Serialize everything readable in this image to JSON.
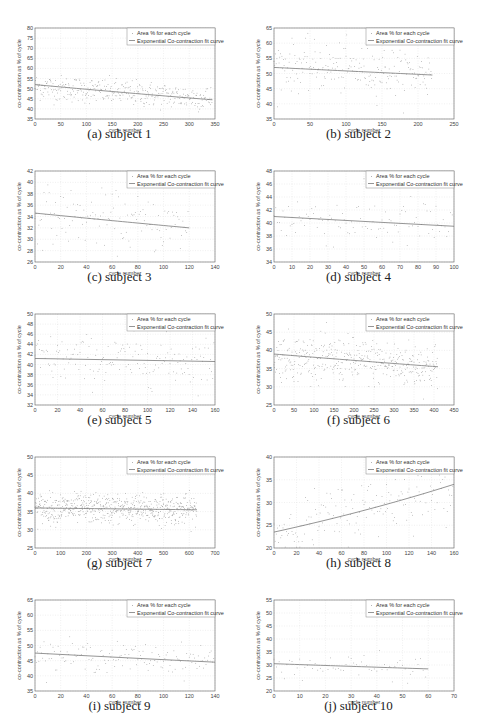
{
  "figure": {
    "common": {
      "ylabel": "co-contraction as % of cycle",
      "xlabel": "cycle number",
      "legend": [
        "Area % for each cycle",
        "Exponential Co-contraction fit curve"
      ]
    }
  },
  "chart_data": [
    {
      "id": "a",
      "type": "scatter",
      "caption": "(a) subject 1",
      "xlabel": "cycle number",
      "ylabel": "co-contraction as % of cycle",
      "xlim": [
        0,
        350
      ],
      "ylim": [
        35,
        80
      ],
      "xticks": [
        0,
        50,
        100,
        150,
        200,
        250,
        300,
        350
      ],
      "yticks": [
        35,
        40,
        45,
        50,
        55,
        60,
        65,
        70,
        75,
        80
      ],
      "legend": [
        "Area % for each cycle",
        "Exponential Co-contraction fit curve"
      ],
      "legend_position": "top-right",
      "grid": true,
      "n_points": 345,
      "scatter_mean_start": 51,
      "scatter_mean_end": 45,
      "scatter_spread": 4,
      "fit": {
        "x_start": 0,
        "x_end": 345,
        "y_start": 52,
        "y_end": 44.5
      }
    },
    {
      "id": "b",
      "type": "scatter",
      "caption": "(b) subject 2",
      "xlabel": "cycle number",
      "ylabel": "co-contraction as % of cycle",
      "xlim": [
        0,
        250
      ],
      "ylim": [
        35,
        65
      ],
      "xticks": [
        0,
        50,
        100,
        150,
        200,
        250
      ],
      "yticks": [
        35,
        40,
        45,
        50,
        55,
        60,
        65
      ],
      "legend": [
        "Area % for each cycle",
        "Exponential Co-contraction fit curve"
      ],
      "legend_position": "top-right",
      "grid": true,
      "n_points": 220,
      "scatter_mean_start": 53,
      "scatter_mean_end": 50,
      "scatter_spread": 5,
      "fit": {
        "x_start": 0,
        "x_end": 220,
        "y_start": 52,
        "y_end": 49.5
      }
    },
    {
      "id": "c",
      "type": "scatter",
      "caption": "(c) subject 3",
      "xlabel": "cycle number",
      "ylabel": "co-contraction as % of cycle",
      "xlim": [
        0,
        140
      ],
      "ylim": [
        26,
        42
      ],
      "xticks": [
        0,
        20,
        40,
        60,
        80,
        100,
        120,
        140
      ],
      "yticks": [
        26,
        28,
        30,
        32,
        34,
        36,
        38,
        40,
        42
      ],
      "legend": [
        "Area % for each cycle",
        "Exponential Co-contraction fit curve"
      ],
      "legend_position": "top-right",
      "grid": true,
      "n_points": 120,
      "scatter_mean_start": 34.5,
      "scatter_mean_end": 32,
      "scatter_spread": 3,
      "fit": {
        "x_start": 0,
        "x_end": 120,
        "y_start": 34.6,
        "y_end": 32
      }
    },
    {
      "id": "d",
      "type": "scatter",
      "caption": "(d) subject 4",
      "xlabel": "cycle number",
      "ylabel": "co-contraction as % of cycle",
      "xlim": [
        0,
        100
      ],
      "ylim": [
        34,
        48
      ],
      "xticks": [
        0,
        10,
        20,
        30,
        40,
        50,
        60,
        70,
        80,
        90,
        100
      ],
      "yticks": [
        34,
        36,
        38,
        40,
        42,
        44,
        46,
        48
      ],
      "legend": [
        "Area % for each cycle",
        "Exponential Co-contraction fit curve"
      ],
      "legend_position": "top-right",
      "grid": true,
      "n_points": 100,
      "scatter_mean_start": 41,
      "scatter_mean_end": 39.5,
      "scatter_spread": 2.5,
      "fit": {
        "x_start": 0,
        "x_end": 100,
        "y_start": 41,
        "y_end": 39.5
      }
    },
    {
      "id": "e",
      "type": "scatter",
      "caption": "(e) subject 5",
      "xlabel": "cycle number",
      "ylabel": "co-contraction as % of cycle",
      "xlim": [
        0,
        160
      ],
      "ylim": [
        32,
        50
      ],
      "xticks": [
        0,
        20,
        40,
        60,
        80,
        100,
        120,
        140,
        160
      ],
      "yticks": [
        32,
        34,
        36,
        38,
        40,
        42,
        44,
        46,
        48,
        50
      ],
      "legend": [
        "Area % for each cycle",
        "Exponential Co-contraction fit curve"
      ],
      "legend_position": "top-right",
      "grid": true,
      "n_points": 160,
      "scatter_mean_start": 41,
      "scatter_mean_end": 40.6,
      "scatter_spread": 3,
      "fit": {
        "x_start": 0,
        "x_end": 160,
        "y_start": 41.2,
        "y_end": 40.6
      }
    },
    {
      "id": "f",
      "type": "scatter",
      "caption": "(f) subject 6",
      "xlabel": "cycle number",
      "ylabel": "co-contraction as % of cycle",
      "xlim": [
        0,
        450
      ],
      "ylim": [
        25,
        50
      ],
      "xticks": [
        0,
        50,
        100,
        150,
        200,
        250,
        300,
        350,
        400,
        450
      ],
      "yticks": [
        25,
        30,
        35,
        40,
        45,
        50
      ],
      "legend": [
        "Area % for each cycle",
        "Exponential Co-contraction fit curve"
      ],
      "legend_position": "top-right",
      "grid": true,
      "n_points": 410,
      "scatter_mean_start": 38.5,
      "scatter_mean_end": 35.5,
      "scatter_spread": 4,
      "fit": {
        "x_start": 0,
        "x_end": 410,
        "y_start": 39,
        "y_end": 35.5
      }
    },
    {
      "id": "g",
      "type": "scatter",
      "caption": "(g) subject 7",
      "xlabel": "cycle number",
      "ylabel": "co-contraction as % of cycle",
      "xlim": [
        0,
        700
      ],
      "ylim": [
        25,
        50
      ],
      "xticks": [
        0,
        100,
        200,
        300,
        400,
        500,
        600,
        700
      ],
      "yticks": [
        25,
        30,
        35,
        40,
        45,
        50
      ],
      "legend": [
        "Area % for each cycle",
        "Exponential Co-contraction fit curve"
      ],
      "legend_position": "top-right",
      "grid": true,
      "n_points": 630,
      "scatter_mean_start": 36,
      "scatter_mean_end": 35.5,
      "scatter_spread": 2.5,
      "fit": {
        "x_start": 0,
        "x_end": 630,
        "y_start": 36,
        "y_end": 35.5
      }
    },
    {
      "id": "h",
      "type": "scatter",
      "caption": "(h) subject 8",
      "xlabel": "cycle number",
      "ylabel": "co-contraction as % of cycle",
      "xlim": [
        0,
        160
      ],
      "ylim": [
        20,
        40
      ],
      "xticks": [
        0,
        20,
        40,
        60,
        80,
        100,
        120,
        140,
        160
      ],
      "yticks": [
        20,
        25,
        30,
        35,
        40
      ],
      "legend": [
        "Area % for each cycle",
        "Exponential Co-contraction fit curve"
      ],
      "legend_position": "top-right",
      "grid": true,
      "n_points": 160,
      "scatter_mean_start": 23.5,
      "scatter_mean_end": 34,
      "scatter_spread": 4,
      "fit": {
        "x_start": 0,
        "x_end": 160,
        "y_start": 23.5,
        "y_end": 34
      }
    },
    {
      "id": "i",
      "type": "scatter",
      "caption": "(i) subject 9",
      "xlabel": "cycle number",
      "ylabel": "co-contraction as % of cycle",
      "xlim": [
        0,
        140
      ],
      "ylim": [
        35,
        65
      ],
      "xticks": [
        0,
        20,
        40,
        60,
        80,
        100,
        120,
        140
      ],
      "yticks": [
        35,
        40,
        45,
        50,
        55,
        60,
        65
      ],
      "legend": [
        "Area % for each cycle",
        "Exponential Co-contraction fit curve"
      ],
      "legend_position": "top-right",
      "grid": true,
      "n_points": 140,
      "scatter_mean_start": 47,
      "scatter_mean_end": 45,
      "scatter_spread": 3,
      "fit": {
        "x_start": 0,
        "x_end": 140,
        "y_start": 47.5,
        "y_end": 44.5
      }
    },
    {
      "id": "j",
      "type": "scatter",
      "caption": "(j) subject 10",
      "xlabel": "cycle number",
      "ylabel": "co-contraction as % of cycle",
      "xlim": [
        0,
        70
      ],
      "ylim": [
        20,
        55
      ],
      "xticks": [
        0,
        10,
        20,
        30,
        40,
        50,
        60,
        70
      ],
      "yticks": [
        20,
        25,
        30,
        35,
        40,
        45,
        50,
        55
      ],
      "legend": [
        "Area % for each cycle",
        "Exponential Co-contraction fit curve"
      ],
      "legend_position": "top-right",
      "grid": true,
      "n_points": 60,
      "scatter_mean_start": 30,
      "scatter_mean_end": 28.5,
      "scatter_spread": 3,
      "fit": {
        "x_start": 0,
        "x_end": 60,
        "y_start": 30.5,
        "y_end": 28.5
      }
    }
  ]
}
